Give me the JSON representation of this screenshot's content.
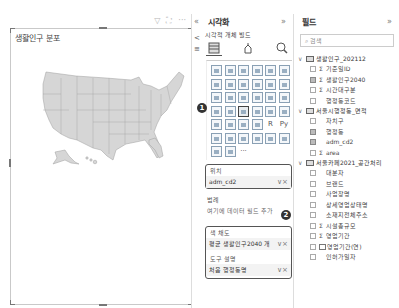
{
  "canvas": {
    "visual_title": "생활인구 분포",
    "header_icons": [
      "filter-icon",
      "focus-mode-icon",
      "more-options-icon"
    ],
    "header_glyphs": [
      "▽",
      "⛶",
      "···"
    ]
  },
  "viz_pane": {
    "collapse_glyph": "«",
    "expand_glyph": "»",
    "title": "시각화",
    "subheading": "시각적 개체 빌드",
    "side_icons": [
      "<",
      "≡"
    ],
    "tabs": [
      {
        "name": "build-visual-tab",
        "active": true
      },
      {
        "name": "format-tab",
        "active": false
      },
      {
        "name": "analytics-tab",
        "active": false
      }
    ],
    "gallery_extra": [
      "R",
      "Py",
      "···"
    ],
    "badge_1": "1",
    "badge_2": "2",
    "wells": {
      "location_label": "위치",
      "location_value": "adm_cd2",
      "legend_label": "범례",
      "legend_hint": "여기에 데이터 필드 추가",
      "saturation_label": "색 채도",
      "saturation_value": "평균 생활인구2040 개",
      "tooltip_label": "도구 설명",
      "tooltip_value": "처음 행정동명",
      "field_actions": "∨×"
    }
  },
  "fields_pane": {
    "title": "필드",
    "expand_glyph": "»",
    "search_placeholder": "검색",
    "tables": [
      {
        "name": "생활인구_202112",
        "fields": [
          {
            "label": "기준일ID",
            "sigma": true,
            "checked": false
          },
          {
            "label": "생활인구2040",
            "sigma": true,
            "checked": true
          },
          {
            "label": "시간대구분",
            "sigma": true,
            "checked": false
          },
          {
            "label": "행정동코드",
            "sigma": false,
            "checked": false
          }
        ]
      },
      {
        "name": "서울시행정동_면적",
        "fields": [
          {
            "label": "자치구",
            "sigma": false,
            "checked": false
          },
          {
            "label": "행정동",
            "sigma": false,
            "checked": true
          },
          {
            "label": "adm_cd2",
            "sigma": false,
            "checked": true
          },
          {
            "label": "area",
            "sigma": true,
            "checked": false
          }
        ]
      },
      {
        "name": "서울카페2021_공간처리",
        "fields": [
          {
            "label": "대분자",
            "sigma": false,
            "checked": false
          },
          {
            "label": "브랜드",
            "sigma": false,
            "checked": false
          },
          {
            "label": "사업장명",
            "sigma": false,
            "checked": false
          },
          {
            "label": "상세영업상태명",
            "sigma": false,
            "checked": false
          },
          {
            "label": "소재지전체주소",
            "sigma": false,
            "checked": false
          },
          {
            "label": "시설총규모",
            "sigma": true,
            "checked": false
          },
          {
            "label": "영업기간",
            "sigma": true,
            "checked": false
          },
          {
            "label": "영업기간(연)",
            "sigma": false,
            "icon": true,
            "checked": false
          },
          {
            "label": "인허가일자",
            "sigma": false,
            "checked": false
          }
        ]
      }
    ]
  }
}
